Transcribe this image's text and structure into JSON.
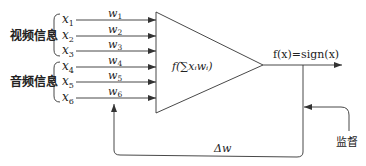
{
  "groups": {
    "video": "视频信息",
    "audio": "音频信息"
  },
  "inputs": [
    {
      "x": "x",
      "sub": "1",
      "w": "w",
      "wsub": "1"
    },
    {
      "x": "x",
      "sub": "2",
      "w": "w",
      "wsub": "2"
    },
    {
      "x": "x",
      "sub": "3",
      "w": "w",
      "wsub": "3"
    },
    {
      "x": "x",
      "sub": "4",
      "w": "w",
      "wsub": "4"
    },
    {
      "x": "x",
      "sub": "5",
      "w": "w",
      "wsub": "5"
    },
    {
      "x": "x",
      "sub": "6",
      "w": "w",
      "wsub": "6"
    }
  ],
  "neuron": {
    "function_label": "f(∑xᵢwᵢ)"
  },
  "output": {
    "label": "f(x)=sign(x)"
  },
  "feedback": {
    "delta_label": "Δw",
    "supervision_label": "监督"
  },
  "colors": {
    "line": "#333333",
    "text": "#222222",
    "background": "#ffffff"
  }
}
